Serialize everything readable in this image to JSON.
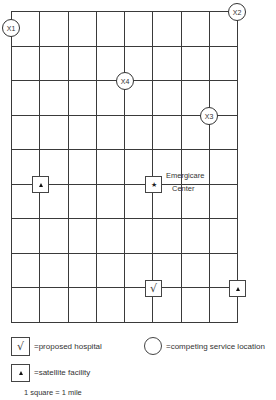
{
  "diagram": {
    "title": "",
    "grid": {
      "columns": 8,
      "rows": 9,
      "left": 11,
      "top": 11,
      "right": 237,
      "bottom": 322,
      "line_color": "#3a3a3a"
    },
    "competing_locations": [
      {
        "id": "X1",
        "label": "X1",
        "cx": 11,
        "cy": 28
      },
      {
        "id": "X2",
        "label": "X2",
        "cx": 237,
        "cy": 12
      },
      {
        "id": "X3",
        "label": "X3",
        "cx": 209,
        "cy": 116
      },
      {
        "id": "X4",
        "label": "X4",
        "cx": 125,
        "cy": 81
      }
    ],
    "facilities": [
      {
        "type": "satellite",
        "symbol": "triangle",
        "cx": 40,
        "cy": 184
      },
      {
        "type": "emergicare",
        "symbol": "star",
        "cx": 153,
        "cy": 184,
        "label_line1": "Emergicare",
        "label_line2": "Center"
      },
      {
        "type": "proposed",
        "symbol": "check",
        "cx": 153,
        "cy": 288
      },
      {
        "type": "satellite",
        "symbol": "triangle",
        "cx": 237,
        "cy": 288
      }
    ],
    "symbols": {
      "check": "√",
      "star": "★"
    },
    "legend": {
      "proposed_hospital": "=proposed hospital",
      "competing_service_location": "=competing service location",
      "satellite_facility": "=satellite facility",
      "scale": "1 square = 1 mile"
    }
  }
}
